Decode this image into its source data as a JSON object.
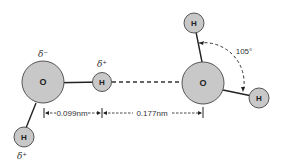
{
  "diagram": {
    "colors": {
      "atom_fill": "#c8c8c8",
      "atom_stroke": "#555555",
      "bond": "#222222",
      "dash": "#333333"
    },
    "atoms": {
      "oxygen_left": "O",
      "oxygen_right": "O",
      "hydrogen_bridge": "H",
      "hydrogen_left_bottom": "H",
      "hydrogen_right_top": "H",
      "hydrogen_right_side": "H"
    },
    "charges": {
      "oxygen_left": "δ⁻",
      "hydrogen_bridge": "δ⁺",
      "hydrogen_left_bottom": "δ⁺"
    },
    "dimensions": {
      "covalent_bond_length": "0.099nm",
      "hydrogen_bond_length": "0.177nm"
    },
    "angle": {
      "bond_angle": "105°"
    }
  }
}
